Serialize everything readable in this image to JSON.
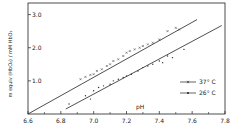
{
  "chart_data": {
    "type": "scatter",
    "title": "",
    "xlabel": "pH",
    "ylabel": "m equiv (HbO2) / mM HbO2",
    "xlim": [
      6.6,
      7.8
    ],
    "ylim": [
      0,
      3.35
    ],
    "xticks": [
      "6.6",
      "6.8",
      "7.0",
      "7.2",
      "7.4",
      "7.6",
      "7.8"
    ],
    "xtick_values": [
      6.6,
      6.8,
      7.0,
      7.2,
      7.4,
      7.6,
      7.8
    ],
    "yticks": [
      "1.0",
      "2.0",
      "3.0"
    ],
    "ytick_values": [
      1.0,
      2.0,
      3.0
    ],
    "legend": {
      "position": "right",
      "entries": [
        {
          "label": "37° C",
          "marker": "x"
        },
        {
          "label": "26° C",
          "marker": "dot"
        }
      ]
    },
    "series": [
      {
        "name": "37° C",
        "fit_line": [
          [
            6.6,
            0.0
          ],
          [
            7.63,
            2.85
          ]
        ],
        "points": [
          [
            6.92,
            1.05
          ],
          [
            6.95,
            1.12
          ],
          [
            6.98,
            1.18
          ],
          [
            7.0,
            1.2
          ],
          [
            7.02,
            1.3
          ],
          [
            7.05,
            1.35
          ],
          [
            7.08,
            1.45
          ],
          [
            7.1,
            1.5
          ],
          [
            7.12,
            1.6
          ],
          [
            7.15,
            1.65
          ],
          [
            7.18,
            1.75
          ],
          [
            7.2,
            1.85
          ],
          [
            7.22,
            1.9
          ],
          [
            7.25,
            1.95
          ],
          [
            7.28,
            2.0
          ],
          [
            7.3,
            2.05
          ],
          [
            7.33,
            2.1
          ],
          [
            7.36,
            2.15
          ],
          [
            7.4,
            2.25
          ],
          [
            7.45,
            2.5
          ],
          [
            7.5,
            2.6
          ],
          [
            7.52,
            2.55
          ]
        ]
      },
      {
        "name": "26° C",
        "fit_line": [
          [
            6.83,
            0.15
          ],
          [
            7.78,
            2.67
          ]
        ],
        "points": [
          [
            6.85,
            0.3
          ],
          [
            6.95,
            0.55
          ],
          [
            6.98,
            0.45
          ],
          [
            7.0,
            0.7
          ],
          [
            7.03,
            0.8
          ],
          [
            7.06,
            0.85
          ],
          [
            7.1,
            0.9
          ],
          [
            7.12,
            1.0
          ],
          [
            7.15,
            1.05
          ],
          [
            7.18,
            1.1
          ],
          [
            7.2,
            1.15
          ],
          [
            7.23,
            1.2
          ],
          [
            7.27,
            1.3
          ],
          [
            7.3,
            1.4
          ],
          [
            7.33,
            1.45
          ],
          [
            7.36,
            1.5
          ],
          [
            7.4,
            1.6
          ],
          [
            7.45,
            1.75
          ],
          [
            7.48,
            1.7
          ],
          [
            7.55,
            1.95
          ],
          [
            7.42,
            1.55
          ]
        ]
      }
    ]
  }
}
